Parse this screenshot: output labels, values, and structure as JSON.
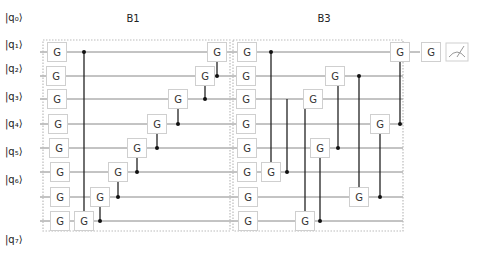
{
  "blocks": [
    {
      "label": "B1",
      "x": 43,
      "y": 40,
      "w": 187,
      "h": 191,
      "label_x": 133,
      "label_y": 22
    },
    {
      "label": "B3",
      "x": 233,
      "y": 40,
      "w": 170,
      "h": 191,
      "label_x": 324,
      "label_y": 22
    }
  ],
  "qubits": [
    {
      "label": "|q₀⟩",
      "y": 21
    },
    {
      "label": "|q₁⟩",
      "y": 48
    },
    {
      "label": "|q₂⟩",
      "y": 72
    },
    {
      "label": "|q₃⟩",
      "y": 100
    },
    {
      "label": "|q₄⟩",
      "y": 127
    },
    {
      "label": "|q₅⟩",
      "y": 155
    },
    {
      "label": "|q₆⟩",
      "y": 183
    },
    {
      "label": "|q₇⟩",
      "y": 243
    }
  ],
  "wires_y": [
    52,
    76,
    99,
    124,
    148,
    172,
    197,
    221
  ],
  "gate_label": "G",
  "gates": [
    {
      "x": 57,
      "row": 0
    },
    {
      "x": 56,
      "row": 1
    },
    {
      "x": 57,
      "row": 2
    },
    {
      "x": 58,
      "row": 3
    },
    {
      "x": 59,
      "row": 4
    },
    {
      "x": 60,
      "row": 5
    },
    {
      "x": 60,
      "row": 6
    },
    {
      "x": 60,
      "row": 7
    },
    {
      "x": 84,
      "row": 7
    },
    {
      "x": 100,
      "row": 6
    },
    {
      "x": 118,
      "row": 5
    },
    {
      "x": 137,
      "row": 4
    },
    {
      "x": 157,
      "row": 3
    },
    {
      "x": 178,
      "row": 2
    },
    {
      "x": 205,
      "row": 1
    },
    {
      "x": 217,
      "row": 0
    },
    {
      "x": 247,
      "row": 0
    },
    {
      "x": 246,
      "row": 1
    },
    {
      "x": 246,
      "row": 2
    },
    {
      "x": 246,
      "row": 3
    },
    {
      "x": 247,
      "row": 4
    },
    {
      "x": 247,
      "row": 5
    },
    {
      "x": 248,
      "row": 6
    },
    {
      "x": 248,
      "row": 7
    },
    {
      "x": 271,
      "row": 5
    },
    {
      "x": 313,
      "row": 2
    },
    {
      "x": 320,
      "row": 4
    },
    {
      "x": 305,
      "row": 7
    },
    {
      "x": 335,
      "row": 1
    },
    {
      "x": 380,
      "row": 3
    },
    {
      "x": 359,
      "row": 6
    },
    {
      "x": 400,
      "row": 0
    },
    {
      "x": 431,
      "row": 0
    }
  ],
  "controlled": [
    {
      "x": 84,
      "ctrl_row": 0,
      "target_row": 7
    },
    {
      "x": 100,
      "ctrl_row": 7,
      "target_row": 6
    },
    {
      "x": 118,
      "ctrl_row": 6,
      "target_row": 5
    },
    {
      "x": 137,
      "ctrl_row": 5,
      "target_row": 4
    },
    {
      "x": 157,
      "ctrl_row": 4,
      "target_row": 3
    },
    {
      "x": 178,
      "ctrl_row": 3,
      "target_row": 2
    },
    {
      "x": 205,
      "ctrl_row": 2,
      "target_row": 1
    },
    {
      "x": 217,
      "ctrl_row": 1,
      "target_row": 0
    },
    {
      "x": 271,
      "ctrl_row": 0,
      "target_row": 5
    },
    {
      "x": 287,
      "ctrl_row": 5,
      "target_row": 2
    },
    {
      "x": 305,
      "ctrl_row": 2,
      "target_row": 7
    },
    {
      "x": 320,
      "ctrl_row": 7,
      "target_row": 4
    },
    {
      "x": 338,
      "ctrl_row": 4,
      "target_row": 1
    },
    {
      "x": 359,
      "ctrl_row": 1,
      "target_row": 6
    },
    {
      "x": 380,
      "ctrl_row": 6,
      "target_row": 3
    },
    {
      "x": 400,
      "ctrl_row": 3,
      "target_row": 0
    }
  ],
  "measurement": {
    "icon": "meter-icon",
    "x": 457,
    "row": 0
  }
}
